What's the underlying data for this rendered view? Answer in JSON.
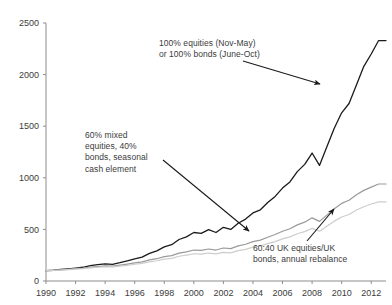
{
  "chart_data": {
    "type": "line",
    "title": "",
    "xlabel": "",
    "ylabel": "",
    "xlim": [
      1990,
      2013
    ],
    "ylim": [
      0,
      2500
    ],
    "grid": false,
    "legend_position": "none (inline annotations with arrows)",
    "x_ticks": [
      "1990",
      "1992",
      "1994",
      "1996",
      "1998",
      "2000",
      "2002",
      "2004",
      "2006",
      "2008",
      "2010",
      "2012"
    ],
    "y_ticks": [
      "0",
      "500",
      "1000",
      "1500",
      "2000",
      "2500"
    ],
    "annotations": [
      {
        "id": "timing",
        "text": "100% equities (Nov-May)\nor 100% bonds (June-Oct)",
        "points_to_series": "100% equities (Nov-May) or 100% bonds (June-Oct)",
        "arrow_from": [
          243,
          61
        ],
        "arrow_to": [
          320,
          84
        ]
      },
      {
        "id": "mixed",
        "text": "60% mixed\nequities, 40%\nbonds, seasonal\ncash element",
        "points_to_series": "60% mixed equities, 40% bonds, seasonal cash element",
        "arrow_from": [
          163,
          160
        ],
        "arrow_to": [
          249,
          231
        ]
      },
      {
        "id": "rebalance",
        "text": "60:40 UK equities/UK\nbonds, annual rebalance",
        "points_to_series": "60:40 UK equities/UK bonds, annual rebalance",
        "arrow_from": [
          307,
          241
        ],
        "arrow_to": [
          334,
          209
        ]
      }
    ],
    "x": [
      1990,
      1990.5,
      1991,
      1991.5,
      1992,
      1992.5,
      1993,
      1993.5,
      1994,
      1994.5,
      1995,
      1995.5,
      1996,
      1996.5,
      1997,
      1997.5,
      1998,
      1998.5,
      1999,
      1999.5,
      2000,
      2000.5,
      2001,
      2001.5,
      2002,
      2002.5,
      2003,
      2003.5,
      2004,
      2004.5,
      2005,
      2005.5,
      2006,
      2006.5,
      2007,
      2007.5,
      2008,
      2008.5,
      2009,
      2009.5,
      2010,
      2010.5,
      2011,
      2011.5,
      2012,
      2012.5,
      2013
    ],
    "series": [
      {
        "name": "100% equities (Nov-May) or 100% bonds (June-Oct)",
        "color": "#1a1a1a",
        "width": 1.3,
        "values": [
          100,
          104,
          112,
          118,
          125,
          133,
          148,
          158,
          165,
          162,
          178,
          196,
          215,
          232,
          268,
          292,
          330,
          352,
          402,
          428,
          470,
          462,
          498,
          470,
          520,
          500,
          560,
          600,
          660,
          690,
          760,
          820,
          900,
          960,
          1060,
          1130,
          1240,
          1120,
          1300,
          1480,
          1630,
          1720,
          1900,
          2080,
          2200,
          2330,
          2330
        ]
      },
      {
        "name": "60% mixed equities, 40% bonds, seasonal cash element",
        "color": "#9a9a9a",
        "width": 1.2,
        "values": [
          100,
          103,
          108,
          113,
          119,
          125,
          134,
          140,
          146,
          145,
          154,
          164,
          175,
          186,
          204,
          216,
          236,
          246,
          270,
          282,
          300,
          297,
          310,
          300,
          320,
          314,
          340,
          356,
          382,
          396,
          424,
          450,
          482,
          506,
          544,
          570,
          612,
          578,
          638,
          700,
          752,
          782,
          836,
          878,
          910,
          940,
          940
        ]
      },
      {
        "name": "60:40 UK equities/UK bonds, annual rebalance",
        "color": "#cdcdcd",
        "width": 1.2,
        "values": [
          100,
          102,
          106,
          110,
          115,
          120,
          128,
          133,
          138,
          136,
          144,
          152,
          162,
          171,
          186,
          196,
          212,
          220,
          240,
          250,
          264,
          260,
          271,
          262,
          278,
          272,
          294,
          307,
          328,
          340,
          362,
          382,
          408,
          428,
          458,
          478,
          510,
          482,
          530,
          580,
          620,
          644,
          688,
          720,
          746,
          766,
          766
        ]
      }
    ],
    "notable_points": {
      "black_dotcom_plateau_2000_2003": 500,
      "black_2008_crash_low": 1120,
      "black_peak_2012": 2450,
      "black_end": 2330,
      "gray_end": 940,
      "light_gray_end": 766,
      "common_start_1990": 100
    }
  }
}
